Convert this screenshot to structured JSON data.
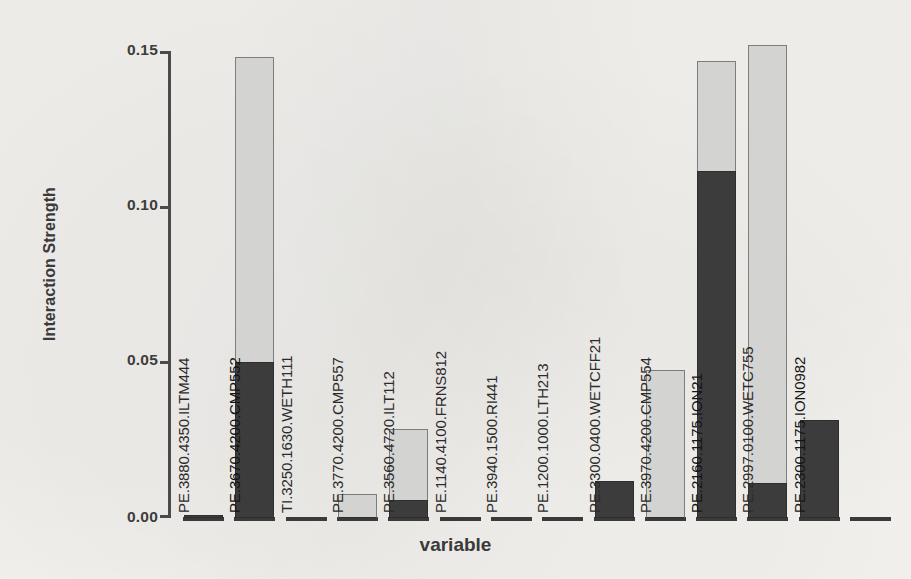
{
  "chart_data": {
    "type": "bar",
    "title": "",
    "subtitle": "",
    "xlabel": "variable",
    "ylabel": "Interaction Strength",
    "ylim": [
      0.0,
      0.15
    ],
    "yticks": [
      "0.00",
      "0.05",
      "0.10",
      "0.15"
    ],
    "ytick_values": [
      0.0,
      0.05,
      0.1,
      0.15
    ],
    "grid": false,
    "legend": "none",
    "stacked": true,
    "orientation": "vertical",
    "bar_label_rotation": -90,
    "series": [
      {
        "name": "lower-segment",
        "color": "#3c3c3c",
        "values": [
          0.001,
          0.05,
          0.0,
          0.0,
          0.0058,
          0.0,
          0.0,
          0.0,
          0.0119,
          0.0,
          0.1113,
          0.0113,
          0.0315,
          0.0
        ]
      },
      {
        "name": "upper-segment",
        "color": "#d3d3d1",
        "values": [
          0.0,
          0.098,
          0.0,
          0.0077,
          0.0228,
          0.0,
          0.0,
          0.0,
          0.0,
          0.0475,
          0.0354,
          0.1407,
          0.0,
          0.0
        ]
      }
    ],
    "totals": [
      0.001,
      0.148,
      0.0,
      0.0077,
      0.0286,
      0.0,
      0.0,
      0.0,
      0.0119,
      0.0475,
      0.1467,
      0.152,
      0.0315,
      0.0
    ],
    "categories": [
      "PE.3880.4350.ILTM444",
      "PE.3670.4200.CMP552",
      "TI.3250.1630.WETH111",
      "PE.3770.4200.CMP557",
      "PE.3560.4720.ILT112",
      "PE.1140.4100.FRNS812",
      "PE.3940.1500.RI441",
      "PE.1200.1000.LTH213",
      "PE.3300.0400.WETCFF21",
      "PE.3970.4200.CMP554",
      "PE.2160.1175.ION21",
      "PE.2997.0100.WETC755",
      "PE.2300.1175.ION0982",
      ""
    ]
  },
  "axis": {
    "y_title": "Interaction Strength",
    "x_title": "variable"
  }
}
